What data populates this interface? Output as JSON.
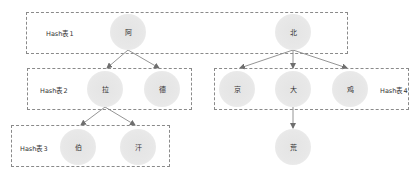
{
  "diagram": {
    "type": "multi-level hash table tree",
    "groups": [
      {
        "id": "g1",
        "label": "Hash表1",
        "x": 26,
        "y": 12,
        "w": 322,
        "h": 42,
        "label_x": 46,
        "label_y": 28
      },
      {
        "id": "g2",
        "label": "Hash表2",
        "x": 27,
        "y": 68,
        "w": 165,
        "h": 42,
        "label_x": 40,
        "label_y": 85
      },
      {
        "id": "g3",
        "label": "Hash表3",
        "x": 11,
        "y": 125,
        "w": 159,
        "h": 42,
        "label_x": 20,
        "label_y": 143
      },
      {
        "id": "g4",
        "label": "Hash表4",
        "x": 214,
        "y": 68,
        "w": 195,
        "h": 42,
        "label_x": 380,
        "label_y": 85
      }
    ],
    "nodes": [
      {
        "id": "n_a",
        "label": "阿",
        "cx": 128,
        "cy": 32,
        "group": "g1"
      },
      {
        "id": "n_bei",
        "label": "北",
        "cx": 293,
        "cy": 32,
        "group": "g1"
      },
      {
        "id": "n_la",
        "label": "拉",
        "cx": 105,
        "cy": 89,
        "group": "g2"
      },
      {
        "id": "n_de",
        "label": "德",
        "cx": 162,
        "cy": 89,
        "group": "g2"
      },
      {
        "id": "n_jing",
        "label": "京",
        "cx": 237,
        "cy": 89,
        "group": "g4"
      },
      {
        "id": "n_da",
        "label": "大",
        "cx": 293,
        "cy": 89,
        "group": "g4"
      },
      {
        "id": "n_ji",
        "label": "鸡",
        "cx": 350,
        "cy": 89,
        "group": "g4"
      },
      {
        "id": "n_bo",
        "label": "伯",
        "cx": 78,
        "cy": 147,
        "group": "g3"
      },
      {
        "id": "n_han",
        "label": "汗",
        "cx": 138,
        "cy": 147,
        "group": "g3"
      },
      {
        "id": "n_huang",
        "label": "荒",
        "cx": 293,
        "cy": 147,
        "group": null
      }
    ],
    "edges": [
      {
        "from": "n_a",
        "to": "n_la",
        "x1": 128,
        "y1": 50,
        "x2": 107,
        "y2": 68
      },
      {
        "from": "n_a",
        "to": "n_de",
        "x1": 128,
        "y1": 50,
        "x2": 159,
        "y2": 68
      },
      {
        "from": "n_bei",
        "to": "n_jing",
        "x1": 293,
        "y1": 50,
        "x2": 240,
        "y2": 68
      },
      {
        "from": "n_bei",
        "to": "n_da",
        "x1": 293,
        "y1": 50,
        "x2": 293,
        "y2": 68
      },
      {
        "from": "n_bei",
        "to": "n_ji",
        "x1": 293,
        "y1": 50,
        "x2": 347,
        "y2": 68
      },
      {
        "from": "n_la",
        "to": "n_bo",
        "x1": 105,
        "y1": 107,
        "x2": 81,
        "y2": 125
      },
      {
        "from": "n_la",
        "to": "n_han",
        "x1": 105,
        "y1": 107,
        "x2": 135,
        "y2": 125
      },
      {
        "from": "n_da",
        "to": "n_huang",
        "x1": 293,
        "y1": 107,
        "x2": 293,
        "y2": 128
      }
    ],
    "colors": {
      "node_fill": "#e8e8e8",
      "box_border": "#8a8a8a",
      "edge": "#7a7a7a",
      "text": "#333333"
    }
  }
}
